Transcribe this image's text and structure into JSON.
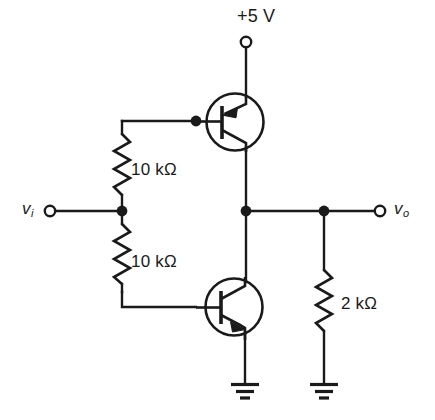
{
  "figure": {
    "kind": "circuit-schematic",
    "title": "",
    "background_color": "#ffffff",
    "line_color": "#1a1a1a"
  },
  "labels": {
    "supply": "+5 V",
    "resistor_r1": "10 kΩ",
    "resistor_r2": "10 kΩ",
    "resistor_rl": "2 kΩ",
    "input_port": "v",
    "input_port_sub": "i",
    "output_port": "v",
    "output_port_sub": "o"
  },
  "components": [
    {
      "id": "supply-terminal",
      "name": "supply-terminal",
      "type": "open-terminal",
      "label": "+5 V",
      "x": 246,
      "y": 42
    },
    {
      "id": "q1",
      "name": "pnp-transistor",
      "type": "bjt-pnp",
      "label": "",
      "cx": 235,
      "cy": 122,
      "r": 28,
      "emitter": "top",
      "collector": "bottom",
      "base": "left"
    },
    {
      "id": "q2",
      "name": "npn-transistor",
      "type": "bjt-npn",
      "label": "",
      "cx": 234,
      "cy": 307,
      "r": 28,
      "collector": "top",
      "emitter": "bottom",
      "base": "left"
    },
    {
      "id": "r1",
      "name": "resistor-upper-divider",
      "type": "resistor",
      "label": "10 kΩ",
      "orientation": "vertical",
      "x": 122,
      "y_top": 133,
      "y_bottom": 198
    },
    {
      "id": "r2",
      "name": "resistor-lower-divider",
      "type": "resistor",
      "label": "10 kΩ",
      "orientation": "vertical",
      "x": 122,
      "y_top": 222,
      "y_bottom": 285
    },
    {
      "id": "rl",
      "name": "resistor-load",
      "type": "resistor",
      "label": "2 kΩ",
      "orientation": "vertical",
      "x": 324,
      "y_top": 268,
      "y_bottom": 336
    },
    {
      "id": "vi",
      "name": "input-terminal",
      "type": "open-terminal",
      "label": "v_i",
      "x": 50,
      "y": 211
    },
    {
      "id": "vo",
      "name": "output-terminal",
      "type": "open-terminal",
      "label": "v_o",
      "x": 380,
      "y": 211
    },
    {
      "id": "gnd1",
      "name": "ground-emitter",
      "type": "ground",
      "label": "",
      "x": 245,
      "y": 383
    },
    {
      "id": "gnd2",
      "name": "ground-load",
      "type": "ground",
      "label": "",
      "x": 324,
      "y": 383
    }
  ],
  "nodes": [
    {
      "name": "node-base-pnp",
      "x": 196,
      "y": 121
    },
    {
      "name": "node-input-divider",
      "x": 122,
      "y": 211
    },
    {
      "name": "node-output-center",
      "x": 246,
      "y": 211
    },
    {
      "name": "node-load-tap",
      "x": 324,
      "y": 211
    }
  ]
}
